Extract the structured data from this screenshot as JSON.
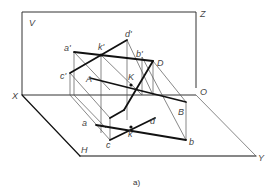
{
  "figure": {
    "caption": "a)",
    "planes": {
      "V": "V",
      "H": "H"
    },
    "axes": {
      "X": "X",
      "Y": "Y",
      "Z": "Z",
      "O": "O"
    },
    "points_space": {
      "A": "A",
      "B": "B",
      "D": "D",
      "K": "K"
    },
    "points_v": {
      "a": "a'",
      "b": "b'",
      "c": "c'",
      "d": "d'",
      "k": "k'"
    },
    "points_h": {
      "a": "a",
      "b": "b",
      "c": "c",
      "d": "d",
      "k": "k"
    },
    "colors": {
      "line": "#111111",
      "thin": "#555555",
      "label": "#444444"
    }
  }
}
